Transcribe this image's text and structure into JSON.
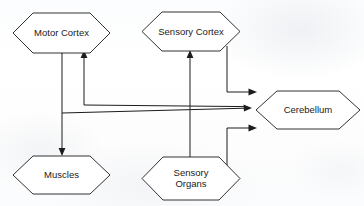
{
  "diagram": {
    "background_color": "#fdfdfd",
    "line_color": "#1c1c1c",
    "node_fill": "#ffffff",
    "nodes": [
      {
        "id": "motor_cortex",
        "label": "Motor Cortex",
        "shape": "hexagon",
        "x": 13,
        "y": 13,
        "width": 97,
        "height": 40
      },
      {
        "id": "sensory_cortex",
        "label": "Sensory Cortex",
        "shape": "hexagon",
        "x": 142,
        "y": 12,
        "width": 98,
        "height": 39
      },
      {
        "id": "cerebellum",
        "label": "Cerebellum",
        "shape": "hexagon",
        "x": 256,
        "y": 91,
        "width": 104,
        "height": 38
      },
      {
        "id": "muscles",
        "label": "Muscles",
        "shape": "hexagon",
        "x": 13,
        "y": 156,
        "width": 97,
        "height": 38
      },
      {
        "id": "sensory_organs",
        "label": "Sensory\nOrgans",
        "shape": "hexagon",
        "x": 142,
        "y": 157,
        "width": 98,
        "height": 43
      }
    ],
    "edges": [
      {
        "id": "motor-to-muscles",
        "from": "motor_cortex",
        "to": "muscles",
        "arrow": "down"
      },
      {
        "id": "motor-to-cerebellum",
        "from": "motor_cortex",
        "to": "cerebellum",
        "arrow": "right"
      },
      {
        "id": "cerebellum-to-motor",
        "from": "cerebellum",
        "to": "motor_cortex",
        "arrow": "up"
      },
      {
        "id": "sensory-organs-to-sensory-cortex",
        "from": "sensory_organs",
        "to": "sensory_cortex",
        "arrow": "up"
      },
      {
        "id": "sensory-cortex-to-cerebellum",
        "from": "sensory_cortex",
        "to": "cerebellum",
        "arrow": "right"
      },
      {
        "id": "sensory-organs-to-cerebellum",
        "from": "sensory_organs",
        "to": "cerebellum",
        "arrow": "right"
      }
    ]
  }
}
